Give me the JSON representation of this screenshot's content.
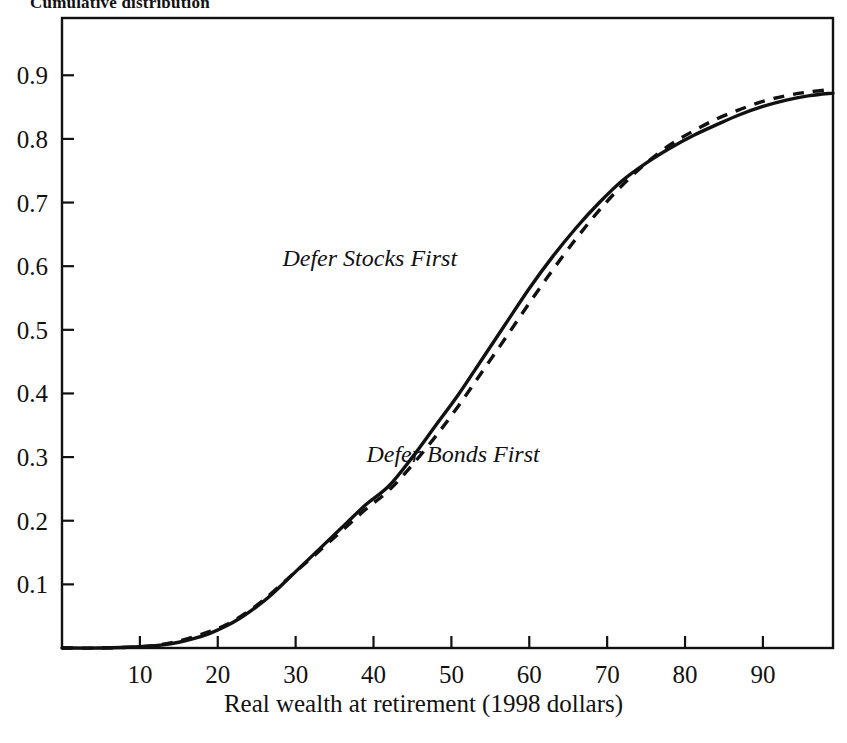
{
  "chart_data": {
    "type": "line",
    "title": "Cumulative distribution",
    "xlabel": "Real wealth at retirement (1998 dollars)",
    "ylabel": "",
    "xlim": [
      0,
      99
    ],
    "ylim": [
      0,
      0.99
    ],
    "grid": false,
    "legend_position": "inline-annotations",
    "xticks": [
      10,
      20,
      30,
      40,
      50,
      60,
      70,
      80,
      90
    ],
    "xtick_labels": [
      "10",
      "20",
      "30",
      "40",
      "50",
      "60",
      "70",
      "80",
      "90"
    ],
    "yticks": [
      0.1,
      0.2,
      0.3,
      0.4,
      0.5,
      0.6,
      0.7,
      0.8,
      0.9
    ],
    "ytick_labels": [
      "0.1",
      "0.2",
      "0.3",
      "0.4",
      "0.5",
      "0.6",
      "0.7",
      "0.8",
      "0.9"
    ],
    "series": [
      {
        "name": "Defer Stocks First",
        "style": "solid",
        "color": "#111111",
        "annotation": "Defer Stocks First",
        "x": [
          0,
          5,
          10,
          13,
          15,
          17,
          19,
          21,
          23,
          25,
          27,
          30,
          33,
          36,
          39,
          42,
          45,
          48,
          51,
          54,
          57,
          60,
          63,
          66,
          69,
          72,
          75,
          78,
          81,
          84,
          87,
          90,
          93,
          96,
          99
        ],
        "values": [
          0.0,
          0.0,
          0.002,
          0.005,
          0.009,
          0.015,
          0.023,
          0.034,
          0.048,
          0.065,
          0.085,
          0.12,
          0.155,
          0.19,
          0.225,
          0.255,
          0.3,
          0.35,
          0.4,
          0.455,
          0.51,
          0.565,
          0.615,
          0.66,
          0.7,
          0.735,
          0.762,
          0.785,
          0.805,
          0.822,
          0.838,
          0.851,
          0.861,
          0.868,
          0.872
        ]
      },
      {
        "name": "Defer Bonds First",
        "style": "dashed",
        "color": "#111111",
        "annotation": "Defer Bonds First",
        "x": [
          0,
          5,
          10,
          13,
          15,
          17,
          19,
          21,
          23,
          25,
          27,
          30,
          33,
          36,
          39,
          42,
          45,
          48,
          51,
          54,
          57,
          60,
          63,
          66,
          69,
          72,
          75,
          78,
          81,
          84,
          87,
          90,
          93,
          96,
          99
        ],
        "values": [
          0.0,
          0.0,
          0.002,
          0.006,
          0.011,
          0.018,
          0.026,
          0.036,
          0.05,
          0.067,
          0.087,
          0.12,
          0.152,
          0.185,
          0.218,
          0.248,
          0.288,
          0.333,
          0.382,
          0.435,
          0.488,
          0.542,
          0.594,
          0.643,
          0.688,
          0.728,
          0.762,
          0.79,
          0.812,
          0.831,
          0.846,
          0.859,
          0.868,
          0.874,
          0.878
        ]
      }
    ],
    "annotations": [
      {
        "text": "Defer Stocks First",
        "x": 45,
        "y": 0.6
      },
      {
        "text": "Defer Bonds First",
        "x": 50,
        "y": 0.305
      }
    ]
  },
  "axis_title": {
    "x": "Real wealth at retirement (1998 dollars)"
  }
}
